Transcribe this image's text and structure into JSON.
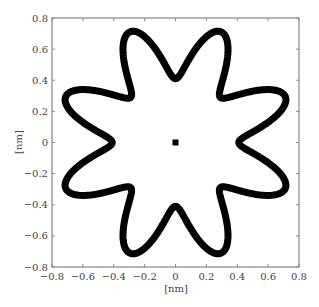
{
  "chart_data": {
    "type": "line",
    "title": "",
    "xlabel": "[nm]",
    "ylabel": "[nm]",
    "xlim": [
      -0.8,
      0.8
    ],
    "ylim": [
      -0.8,
      0.8
    ],
    "xticks": [
      -0.8,
      -0.6,
      -0.4,
      -0.2,
      0,
      0.2,
      0.4,
      0.6,
      0.8
    ],
    "yticks": [
      -0.8,
      -0.6,
      -0.4,
      -0.2,
      0,
      0.2,
      0.4,
      0.6,
      0.8
    ],
    "xtick_labels": [
      "−0.8",
      "−0.6",
      "−0.4",
      "−0.2",
      "0",
      "0.2",
      "0.4",
      "0.6",
      "0.8"
    ],
    "ytick_labels": [
      "−0.8",
      "−0.6",
      "−0.4",
      "−0.2",
      "0",
      "0.2",
      "0.4",
      "0.6",
      "0.8"
    ],
    "grid": false,
    "legend": null,
    "series": [
      {
        "name": "eight-lobed star contour",
        "shape": "polar",
        "equation": "r(theta) = 0.59 - 0.18*cos(8*theta)",
        "lobes": 8,
        "tip_radius_nm": 0.77,
        "valley_radius_nm": 0.41,
        "tip_angles_deg": [
          22.5,
          67.5,
          112.5,
          157.5,
          202.5,
          247.5,
          292.5,
          337.5
        ],
        "valley_angles_deg": [
          0,
          45,
          90,
          135,
          180,
          225,
          270,
          315
        ],
        "color": "#000000",
        "line_width_px": 7
      },
      {
        "name": "center marker",
        "shape": "square",
        "x": [
          0
        ],
        "y": [
          0
        ],
        "color": "#000000"
      }
    ]
  },
  "colors": {
    "background": "#ffffff",
    "axes": "#888888",
    "curve": "#000000",
    "text": "#444444"
  }
}
